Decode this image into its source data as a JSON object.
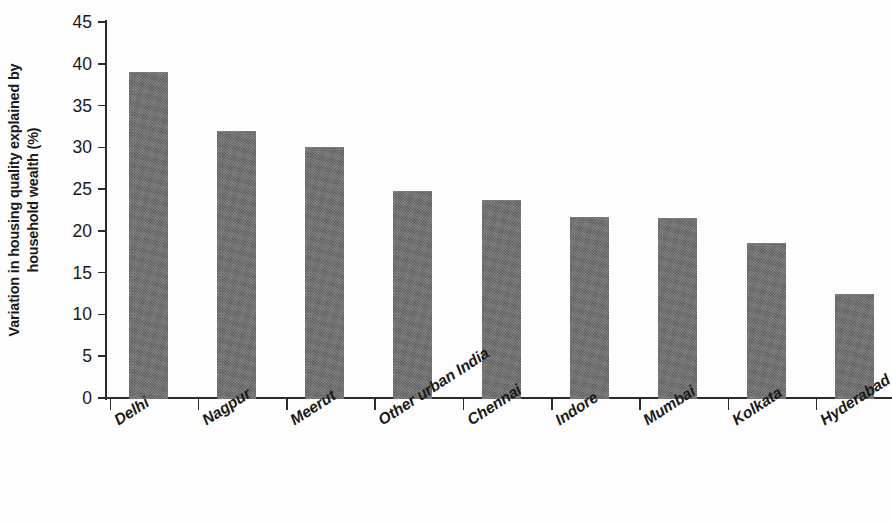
{
  "chart_data": {
    "type": "bar",
    "title": "",
    "subtitle": "",
    "xlabel": "",
    "ylabel": "Variation in housing quality explained by household wealth (%)",
    "ylabel_line1": "Variation in housing quality explained by",
    "ylabel_line2": "household wealth (%)",
    "ylim": [
      0,
      45
    ],
    "ytick_labels": [
      "45",
      "40",
      "35",
      "30",
      "25",
      "20",
      "15",
      "10",
      "5",
      "0"
    ],
    "ytick_values": [
      45,
      40,
      35,
      30,
      25,
      20,
      15,
      10,
      5,
      0
    ],
    "grid": false,
    "legend": false,
    "legend_position": "none",
    "bar_color": "#6e6e6e",
    "axis_color": "#2b2b2b",
    "background_color": "#ffffff",
    "categories": [
      "Delhi",
      "Nagpur",
      "Meerut",
      "Other urban India",
      "Chennai",
      "Indore",
      "Mumbai",
      "Kolkata",
      "Hyderabad"
    ],
    "values": [
      39.0,
      32.0,
      30.0,
      24.8,
      23.7,
      21.7,
      21.5,
      18.6,
      12.4
    ],
    "series": [
      {
        "name": "Variation in housing quality explained by household wealth (%)",
        "values": [
          39.0,
          32.0,
          30.0,
          24.8,
          23.7,
          21.7,
          21.5,
          18.6,
          12.4
        ]
      }
    ],
    "annotations": []
  }
}
